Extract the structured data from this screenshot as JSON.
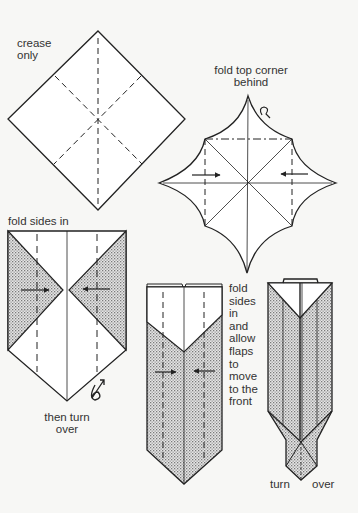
{
  "colors": {
    "background": "#f7f7f5",
    "line": "#222222",
    "shade": "#bdbdbd"
  },
  "steps": [
    {
      "id": 1,
      "label_lines": [
        "crease",
        "only"
      ]
    },
    {
      "id": 2,
      "label_lines": [
        "fold top corner",
        "behind"
      ]
    },
    {
      "id": 3,
      "label_lines": [
        "fold sides in"
      ],
      "footer_lines": [
        "then turn",
        "over"
      ]
    },
    {
      "id": 4,
      "label_lines": [
        "fold",
        "sides",
        "in",
        "and",
        "allow",
        "flaps",
        "to",
        "move",
        "to the",
        "front"
      ]
    },
    {
      "id": 5,
      "footer_left": "turn",
      "footer_right": "over"
    }
  ],
  "icons": [
    "fold-behind-arrow-icon",
    "turn-over-icon",
    "push-arrow-icon"
  ]
}
